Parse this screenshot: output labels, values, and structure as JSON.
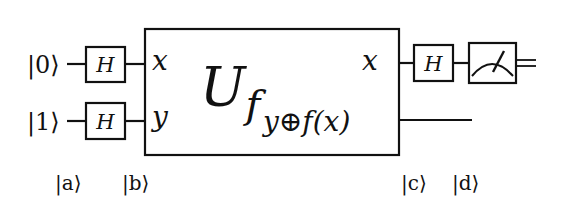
{
  "diagram": {
    "type": "quantum-circuit",
    "inputs": [
      {
        "label": "|0⟩"
      },
      {
        "label": "|1⟩"
      }
    ],
    "input_gates": [
      {
        "label": "H"
      },
      {
        "label": "H"
      }
    ],
    "oracle": {
      "name_main": "U",
      "name_sub": "f",
      "in_top": "x",
      "in_bottom": "y",
      "out_top": "x",
      "out_bottom_y": "y",
      "out_bottom_op": "⊕",
      "out_bottom_f": "f(x)"
    },
    "output_gate": {
      "label": "H"
    },
    "measurement": {
      "icon": "meter-icon"
    },
    "stage_labels": [
      {
        "label": "|a⟩"
      },
      {
        "label": "|b⟩"
      },
      {
        "label": "|c⟩"
      },
      {
        "label": "|d⟩"
      }
    ],
    "colors": {
      "ink": "#111111",
      "background": "#ffffff"
    }
  }
}
